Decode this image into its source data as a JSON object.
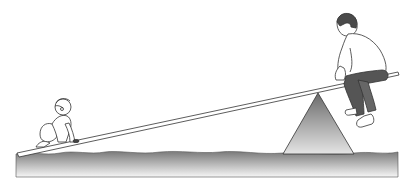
{
  "scene": {
    "description": "Seesaw illustration: a baby crawling on the low end of a plank and an older boy sitting on the high end, plank resting on a triangular fulcrum over wavy ground",
    "figures": [
      {
        "id": "baby",
        "label": "crawling baby",
        "position": "left end of plank"
      },
      {
        "id": "boy",
        "label": "seated boy",
        "position": "right end of plank"
      }
    ],
    "objects": [
      "plank",
      "fulcrum",
      "ground"
    ],
    "colors": {
      "background": "#ffffff",
      "outline": "#333333",
      "ground_top": "#7a7a7a",
      "ground_bottom": "#f4f4f4",
      "fulcrum_top": "#6e6e6e",
      "fulcrum_bottom": "#e2e2e2",
      "pants": "#555555",
      "hair": "#4a4a4a"
    }
  }
}
